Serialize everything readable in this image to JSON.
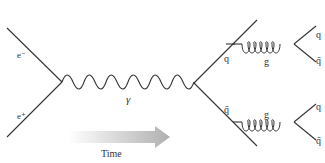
{
  "diagram": {
    "colors": {
      "line": "#333333",
      "arrow_start": "#ffffff",
      "arrow_end": "#b5b5b5",
      "label": "#333333"
    },
    "particles": {
      "electron": "e⁻",
      "positron": "e⁺",
      "photon": "γ",
      "quark": "q",
      "antiquark": "q̄",
      "gluon_top": "g",
      "gluon_bottom": "g",
      "top_out_q": "q",
      "top_out_qbar": "q̄",
      "bottom_out_q": "q",
      "bottom_out_qbar": "q̄"
    },
    "time_arrow": {
      "label": "Time"
    }
  }
}
